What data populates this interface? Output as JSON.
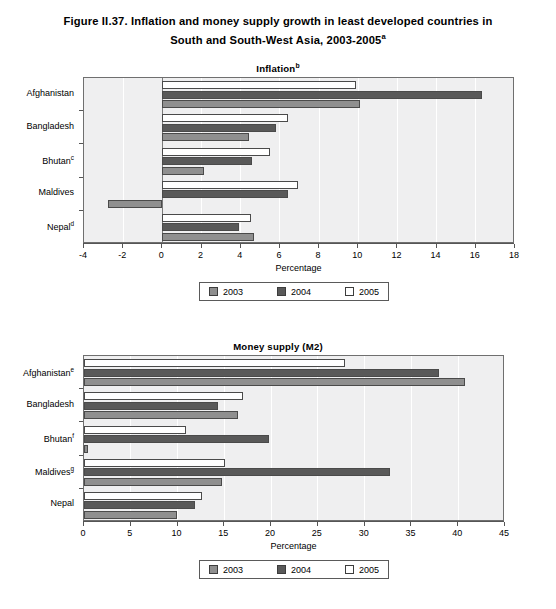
{
  "figure": {
    "title_line1": "Figure II.37. Inflation and money supply growth in least developed countries in",
    "title_line2": "South and South-West Asia, 2003-2005",
    "title_superscript": "a"
  },
  "legend": {
    "items": [
      {
        "label": "2003",
        "swatch": "medium-gray",
        "color": "#8f8f8f"
      },
      {
        "label": "2004",
        "swatch": "dark-gray",
        "color": "#595959"
      },
      {
        "label": "2005",
        "swatch": "white",
        "color": "#ffffff"
      }
    ]
  },
  "chart_data": [
    {
      "type": "bar",
      "orientation": "horizontal",
      "title": "Inflation",
      "title_superscript": "b",
      "xlabel": "Percentage",
      "ylabel": "",
      "xlim": [
        -4,
        18
      ],
      "xticks": [
        -4,
        -2,
        0,
        2,
        4,
        6,
        8,
        10,
        12,
        14,
        16,
        18
      ],
      "xtick_labels": [
        "-4",
        "-2",
        "0",
        "2",
        "4",
        "6",
        "8",
        "10",
        "12",
        "14",
        "16",
        "18"
      ],
      "grid": true,
      "legend_position": "bottom-center",
      "categories": [
        "Afghanistan",
        "Bangladesh",
        "Bhutan",
        "Maldives",
        "Nepal"
      ],
      "category_superscripts": [
        "",
        "",
        "c",
        "",
        "d"
      ],
      "series": [
        {
          "name": "2003",
          "color": "#8f8f8f",
          "values": [
            10.1,
            4.4,
            2.1,
            -2.8,
            4.7
          ]
        },
        {
          "name": "2004",
          "color": "#595959",
          "values": [
            16.3,
            5.8,
            4.6,
            6.4,
            3.9
          ]
        },
        {
          "name": "2005",
          "color": "#ffffff",
          "values": [
            9.9,
            6.4,
            5.5,
            6.9,
            4.5
          ]
        }
      ]
    },
    {
      "type": "bar",
      "orientation": "horizontal",
      "title": "Money supply (M2)",
      "title_superscript": "",
      "xlabel": "Percentage",
      "ylabel": "",
      "xlim": [
        0,
        45
      ],
      "xticks": [
        0,
        5,
        10,
        15,
        20,
        25,
        30,
        35,
        40,
        45
      ],
      "xtick_labels": [
        "0",
        "5",
        "10",
        "15",
        "20",
        "25",
        "30",
        "35",
        "40",
        "45"
      ],
      "grid": true,
      "legend_position": "bottom-center",
      "categories": [
        "Afghanistan",
        "Bangladesh",
        "Bhutan",
        "Maldives",
        "Nepal"
      ],
      "category_superscripts": [
        "e",
        "",
        "f",
        "g",
        ""
      ],
      "series": [
        {
          "name": "2003",
          "color": "#8f8f8f",
          "values": [
            40.7,
            16.5,
            0.4,
            14.7,
            9.9
          ]
        },
        {
          "name": "2004",
          "color": "#595959",
          "values": [
            37.9,
            14.3,
            19.8,
            32.7,
            11.9
          ]
        },
        {
          "name": "2005",
          "color": "#ffffff",
          "values": [
            27.9,
            17.0,
            10.9,
            15.1,
            12.6
          ]
        }
      ]
    }
  ]
}
